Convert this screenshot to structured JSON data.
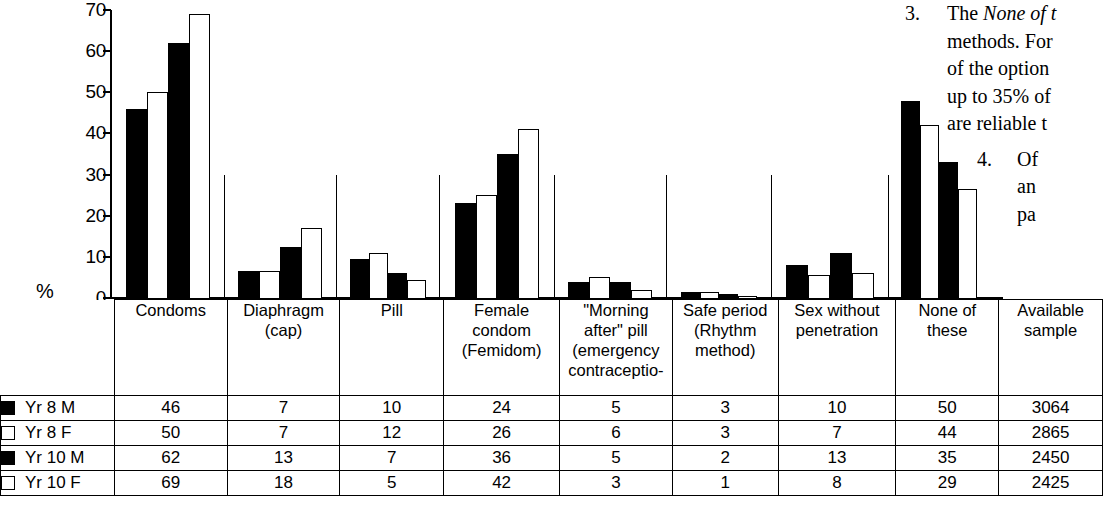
{
  "chart_data": {
    "type": "bar",
    "title": "",
    "xlabel": "",
    "ylabel": "%",
    "ylim": [
      0,
      70
    ],
    "yticks": [
      "0",
      "10",
      "20",
      "30",
      "40",
      "50",
      "60",
      "70"
    ],
    "grid": false,
    "legend_position": "table-left",
    "categories": [
      "Condoms",
      "Diaphragm (cap)",
      "Pill",
      "Female condom (Femidom)",
      "\"Morning after\" pill (emergency contraceptio-",
      "Safe period (Rhythm method)",
      "Sex without penetration",
      "None of these"
    ],
    "series": [
      {
        "name": "Yr 8 M",
        "style": "dark",
        "values": [
          46,
          7,
          10,
          24,
          5,
          3,
          10,
          50
        ],
        "plotted": [
          46,
          6.5,
          9.5,
          23,
          4,
          1.5,
          8,
          48
        ]
      },
      {
        "name": "Yr 8 F",
        "style": "light",
        "values": [
          50,
          7,
          12,
          26,
          6,
          3,
          7,
          44
        ],
        "plotted": [
          50,
          6.5,
          11,
          25,
          5,
          1.5,
          5.5,
          42
        ]
      },
      {
        "name": "Yr 10 M",
        "style": "dark",
        "values": [
          62,
          13,
          7,
          36,
          5,
          2,
          13,
          35
        ],
        "plotted": [
          62,
          12.5,
          6,
          35,
          4,
          1,
          11,
          33
        ]
      },
      {
        "name": "Yr 10 F",
        "style": "light",
        "values": [
          69,
          18,
          5,
          42,
          3,
          1,
          8,
          29
        ],
        "plotted": [
          69,
          17,
          4.5,
          41,
          2,
          0.5,
          6,
          26.5
        ]
      }
    ]
  },
  "table": {
    "columns": [
      "Condoms",
      "Diaphragm\n(cap)",
      "Pill",
      "Female\ncondom\n(Femidom)",
      "\"Morning\nafter\" pill\n(emergency\ncontraceptio-",
      "Safe period\n(Rhythm\nmethod)",
      "Sex without\npenetration",
      "None of these",
      "Available\nsample"
    ],
    "column_lines": [
      [
        "Condoms"
      ],
      [
        "Diaphragm",
        "(cap)"
      ],
      [
        "Pill"
      ],
      [
        "Female",
        "condom",
        "(Femidom)"
      ],
      [
        "\"Morning",
        "after\" pill",
        "(emergency",
        "contraceptio-"
      ],
      [
        "Safe period",
        "(Rhythm",
        "method)"
      ],
      [
        "Sex without",
        "penetration"
      ],
      [
        "None of these"
      ],
      [
        "Available",
        "sample"
      ]
    ],
    "rows": [
      {
        "swatch": "dark",
        "label": "Yr 8 M",
        "values": [
          "46",
          "7",
          "10",
          "24",
          "5",
          "3",
          "10",
          "50",
          "3064"
        ]
      },
      {
        "swatch": "light",
        "label": "Yr 8 F",
        "values": [
          "50",
          "7",
          "12",
          "26",
          "6",
          "3",
          "7",
          "44",
          "2865"
        ]
      },
      {
        "swatch": "dark",
        "label": "Yr 10 M",
        "values": [
          "62",
          "13",
          "7",
          "36",
          "5",
          "2",
          "13",
          "35",
          "2450"
        ]
      },
      {
        "swatch": "light",
        "label": "Yr 10 F",
        "values": [
          "69",
          "18",
          "5",
          "42",
          "3",
          "1",
          "8",
          "29",
          "2425"
        ]
      }
    ]
  },
  "sidetext": {
    "items": [
      {
        "number": "3.",
        "lines": [
          {
            "pre": "The ",
            "em": "None of t",
            "post": ""
          },
          {
            "pre": "methods. For",
            "em": "",
            "post": ""
          },
          {
            "pre": "of the option",
            "em": "",
            "post": ""
          },
          {
            "pre": "up to 35% of",
            "em": "",
            "post": ""
          },
          {
            "pre": "are reliable t",
            "em": "",
            "post": ""
          }
        ]
      },
      {
        "number": "4.",
        "lines": [
          {
            "pre": "Of",
            "em": "",
            "post": ""
          },
          {
            "pre": "an",
            "em": "",
            "post": ""
          },
          {
            "pre": "pa",
            "em": "",
            "post": ""
          }
        ]
      }
    ]
  },
  "colors": {
    "dark_series": "#000000",
    "light_series": "#ffffff",
    "stroke": "#000000",
    "background": "#ffffff"
  }
}
